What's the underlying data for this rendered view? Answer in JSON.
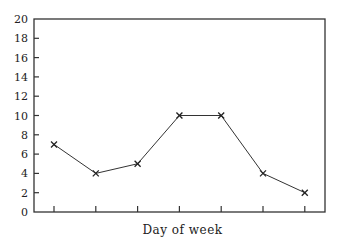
{
  "chart_data": {
    "type": "line",
    "title": "",
    "xlabel": "Day of week",
    "ylabel": "",
    "x": [
      1,
      2,
      3,
      4,
      5,
      6,
      7
    ],
    "x_tick_labels": [
      "",
      "",
      "",
      "",
      "",
      "",
      ""
    ],
    "series": [
      {
        "name": "value",
        "values": [
          7,
          4,
          5,
          10,
          10,
          4,
          2
        ],
        "marker": "x"
      }
    ],
    "ylim": [
      0,
      20
    ],
    "y_ticks": [
      0,
      2,
      4,
      6,
      8,
      10,
      12,
      14,
      16,
      18,
      20
    ],
    "grid": false,
    "legend": "none"
  }
}
